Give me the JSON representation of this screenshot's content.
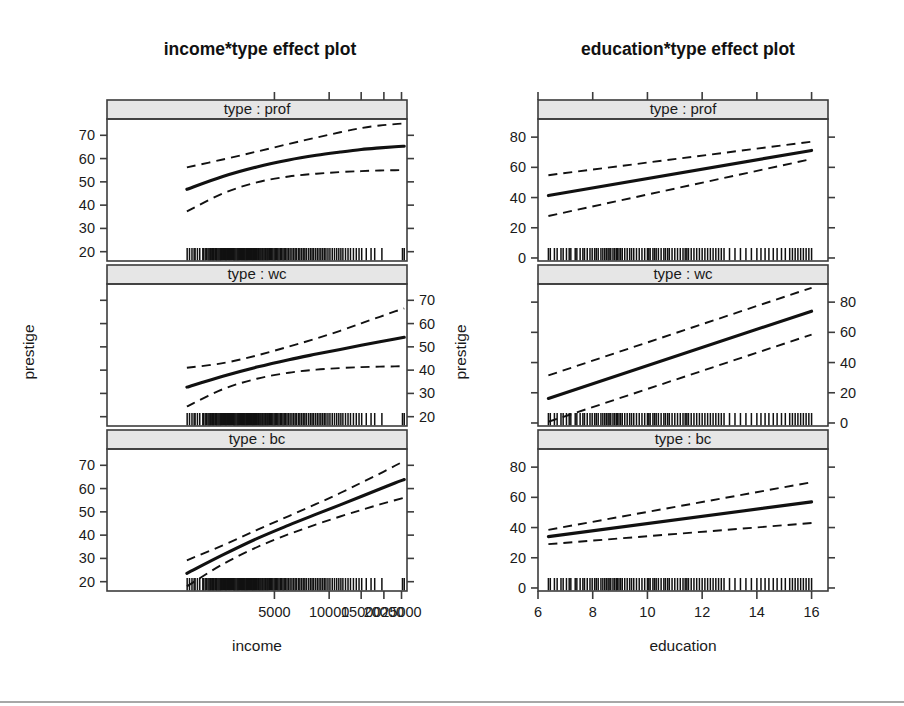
{
  "figure": {
    "width": 904,
    "height": 706,
    "background": "#ffffff",
    "bottom_rule": true,
    "line_color": "#111111",
    "strip_fill": "#e6e6e6",
    "frame_color": "#3c3c3c"
  },
  "panels": {
    "left": {
      "title": "income*type effect plot",
      "xlabel": "income",
      "ylabel": "prestige",
      "strip_labels": [
        "type : prof",
        "type : wc",
        "type : bc"
      ]
    },
    "right": {
      "title": "education*type effect plot",
      "xlabel": "education",
      "ylabel": "prestige",
      "strip_labels": [
        "type : prof",
        "type : wc",
        "type : bc"
      ]
    }
  },
  "chart_data": [
    {
      "type": "line",
      "id": "income-effect",
      "title": "income*type effect plot",
      "xlabel": "income",
      "ylabel": "prestige",
      "grid": false,
      "legend": "none",
      "xlim": [
        600,
        26800
      ],
      "xticks": [
        5000,
        10000,
        15000,
        20000,
        25000
      ],
      "xtick_labels": [
        "5000",
        "10000",
        "15000",
        "20000",
        "25000"
      ],
      "ylim": [
        16,
        77
      ],
      "yticks": [
        20,
        30,
        40,
        50,
        60,
        70
      ],
      "ytick_labels": [
        "20",
        "30",
        "40",
        "50",
        "60",
        "70"
      ],
      "x_scale": "log",
      "facets": [
        {
          "name": "type : prof",
          "axis_side": "left",
          "x": [
            1650,
            2600,
            4000,
            6000,
            8500,
            11500,
            15000,
            19000,
            23000,
            25879
          ],
          "fit": [
            46.8,
            52.3,
            56.4,
            59.4,
            61.4,
            62.8,
            63.9,
            64.6,
            65.1,
            65.3
          ],
          "lower": [
            37.3,
            45.0,
            49.8,
            52.3,
            53.5,
            54.2,
            54.6,
            54.9,
            55.0,
            55.1
          ],
          "upper": [
            56.2,
            59.6,
            63.0,
            66.3,
            69.0,
            71.3,
            73.1,
            74.2,
            74.8,
            75.1
          ]
        },
        {
          "name": "type : wc",
          "axis_side": "right",
          "x": [
            1650,
            2600,
            4000,
            6000,
            8500,
            11500,
            15000,
            19000,
            23000,
            25879
          ],
          "fit": [
            32.7,
            37.4,
            41.3,
            44.5,
            46.9,
            48.9,
            50.7,
            52.2,
            53.4,
            54.1
          ],
          "lower": [
            24.4,
            31.8,
            36.3,
            38.9,
            40.2,
            40.9,
            41.3,
            41.5,
            41.6,
            41.7
          ],
          "upper": [
            41.0,
            43.0,
            46.3,
            50.1,
            53.6,
            56.9,
            60.1,
            62.9,
            65.2,
            66.5
          ]
        },
        {
          "name": "type : bc",
          "axis_side": "left",
          "x": [
            1650,
            2600,
            4000,
            6000,
            8500,
            11500,
            15000,
            19000,
            23000,
            25879
          ],
          "fit": [
            23.6,
            31.5,
            38.5,
            44.3,
            49.0,
            53.0,
            56.6,
            59.8,
            62.4,
            63.9
          ],
          "lower": [
            18.0,
            27.5,
            34.8,
            40.4,
            44.6,
            48.0,
            50.8,
            53.2,
            55.0,
            56.1
          ],
          "upper": [
            29.2,
            35.6,
            42.2,
            48.2,
            53.4,
            58.1,
            62.5,
            66.4,
            69.8,
            71.8
          ]
        }
      ],
      "rug": [
        1656,
        1706,
        1760,
        1809,
        1831,
        1886,
        1942,
        2020,
        2034,
        2080,
        2112,
        2154,
        2184,
        2213,
        2231,
        2263,
        2287,
        2308,
        2330,
        2370,
        2393,
        2416,
        2448,
        2480,
        2511,
        2535,
        2560,
        2594,
        2622,
        2662,
        2693,
        2716,
        2754,
        2793,
        2822,
        2860,
        2898,
        2938,
        2983,
        3000,
        3035,
        3073,
        3116,
        3148,
        3184,
        3221,
        3263,
        3302,
        3334,
        3371,
        3411,
        3447,
        3485,
        3522,
        3560,
        3600,
        3645,
        3686,
        3730,
        3772,
        3807,
        3846,
        3888,
        3930,
        3976,
        4020,
        4075,
        4120,
        4172,
        4224,
        4283,
        4330,
        4390,
        4455,
        4500,
        4562,
        4620,
        4690,
        4757,
        4822,
        4900,
        4980,
        5052,
        5134,
        5218,
        5300,
        5390,
        5472,
        5570,
        5660,
        5762,
        5865,
        5980,
        6100,
        6240,
        6370,
        6500,
        6620,
        6780,
        6900,
        7050,
        7200,
        7350,
        7500,
        7700,
        7880,
        8050,
        8200,
        8400,
        8600,
        8800,
        9000,
        9200,
        9400,
        9600,
        9850,
        10100,
        10400,
        10700,
        11000,
        11300,
        11600,
        11900,
        12300,
        12700,
        13100,
        13600,
        14100,
        14600,
        15100,
        16000,
        17000,
        17800,
        19500,
        25308,
        25879
      ],
      "rug_position": "bottom-inside"
    },
    {
      "type": "line",
      "id": "education-effect",
      "title": "education*type effect plot",
      "xlabel": "education",
      "ylabel": "prestige",
      "grid": false,
      "legend": "none",
      "xlim": [
        6.0,
        16.6
      ],
      "xticks": [
        6,
        8,
        10,
        12,
        14,
        16
      ],
      "xtick_labels": [
        "6",
        "8",
        "10",
        "12",
        "14",
        "16"
      ],
      "ylim": [
        -2,
        92
      ],
      "yticks": [
        0,
        20,
        40,
        60,
        80
      ],
      "ytick_labels": [
        "0",
        "20",
        "40",
        "60",
        "80"
      ],
      "x_scale": "linear",
      "facets": [
        {
          "name": "type : prof",
          "axis_side": "left",
          "x": [
            6.38,
            16.0
          ],
          "fit": [
            41.3,
            71.2
          ],
          "lower": [
            27.8,
            65.5
          ],
          "upper": [
            54.8,
            77.0
          ]
        },
        {
          "name": "type : wc",
          "axis_side": "right",
          "x": [
            6.38,
            16.0
          ],
          "fit": [
            16.2,
            74.0
          ],
          "lower": [
            0.8,
            58.5
          ],
          "upper": [
            31.5,
            89.5
          ]
        },
        {
          "name": "type : bc",
          "axis_side": "left",
          "x": [
            6.38,
            16.0
          ],
          "fit": [
            34.0,
            57.0
          ],
          "lower": [
            29.0,
            43.0
          ],
          "upper": [
            38.5,
            70.0
          ]
        }
      ],
      "rug": [
        6.38,
        6.45,
        6.6,
        6.7,
        6.84,
        6.92,
        7.04,
        7.14,
        7.2,
        7.36,
        7.42,
        7.54,
        7.64,
        7.7,
        7.8,
        7.9,
        7.98,
        8.07,
        8.13,
        8.2,
        8.3,
        8.37,
        8.44,
        8.5,
        8.56,
        8.6,
        8.66,
        8.74,
        8.8,
        8.86,
        8.9,
        8.96,
        9.02,
        9.08,
        9.17,
        9.26,
        9.35,
        9.42,
        9.5,
        9.6,
        9.7,
        9.8,
        9.9,
        10.0,
        10.05,
        10.1,
        10.2,
        10.26,
        10.32,
        10.4,
        10.5,
        10.6,
        10.66,
        10.74,
        10.8,
        10.9,
        11.0,
        11.1,
        11.2,
        11.3,
        11.38,
        11.44,
        11.5,
        11.6,
        11.7,
        11.8,
        11.9,
        12.0,
        12.1,
        12.2,
        12.3,
        12.4,
        12.5,
        12.6,
        12.7,
        12.8,
        13.0,
        13.2,
        13.4,
        13.6,
        13.8,
        14.0,
        14.15,
        14.3,
        14.44,
        14.6,
        14.74,
        14.9,
        15.04,
        15.2,
        15.3,
        15.4,
        15.5,
        15.6,
        15.7,
        15.8,
        15.9,
        16.0
      ],
      "rug_position": "bottom-inside"
    }
  ]
}
